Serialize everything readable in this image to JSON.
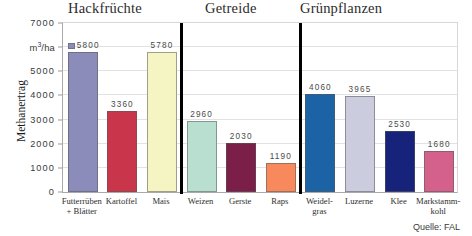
{
  "chart_data": {
    "type": "bar",
    "title": "",
    "xlabel": "",
    "ylabel": "Methanertrag",
    "yunit": "m³/ha",
    "ylim": [
      0,
      7000
    ],
    "grid": true,
    "legend_position": "none",
    "source_note": "Quelle: FAL",
    "yticks": [
      {
        "value": 7000,
        "label": "7000",
        "is_unit": false
      },
      {
        "value": 6000,
        "label": "m³/ha",
        "is_unit": true
      },
      {
        "value": 5000,
        "label": "5000",
        "is_unit": false
      },
      {
        "value": 4000,
        "label": "4000",
        "is_unit": false
      },
      {
        "value": 3000,
        "label": "3000",
        "is_unit": false
      },
      {
        "value": 2000,
        "label": "2000",
        "is_unit": false
      },
      {
        "value": 1000,
        "label": "1000",
        "is_unit": false
      },
      {
        "value": 0,
        "label": "0",
        "is_unit": false
      }
    ],
    "groups": [
      {
        "name": "Hackfrüchte",
        "start": 0,
        "count": 3
      },
      {
        "name": "Getreide",
        "start": 3,
        "count": 3
      },
      {
        "name": "Grünpflanzen",
        "start": 6,
        "count": 4
      }
    ],
    "categories": [
      "Futterrüben + Blätter",
      "Kartoffel",
      "Mais",
      "Weizen",
      "Gerste",
      "Raps",
      "Weidel-gras",
      "Luzerne",
      "Klee",
      "Markstamm-kohl"
    ],
    "values": [
      5800,
      3360,
      5780,
      2960,
      2030,
      1190,
      4060,
      3965,
      2530,
      1680
    ],
    "bars": [
      {
        "category_lines": [
          "Futterrüben",
          "+ Blätter"
        ],
        "value": 5800,
        "label": "5800",
        "color": "#8b8cba",
        "has_marker": true
      },
      {
        "category_lines": [
          "Kartoffel"
        ],
        "value": 3360,
        "label": "3360",
        "color": "#c9354a",
        "has_marker": false
      },
      {
        "category_lines": [
          "Mais"
        ],
        "value": 5780,
        "label": "5780",
        "color": "#f5f4c3",
        "has_marker": false
      },
      {
        "category_lines": [
          "Weizen"
        ],
        "value": 2960,
        "label": "2960",
        "color": "#b8dfd0",
        "has_marker": false
      },
      {
        "category_lines": [
          "Gerste"
        ],
        "value": 2030,
        "label": "2030",
        "color": "#7b1f48",
        "has_marker": false
      },
      {
        "category_lines": [
          "Raps"
        ],
        "value": 1190,
        "label": "1190",
        "color": "#f7895c",
        "has_marker": false
      },
      {
        "category_lines": [
          "Weidel-",
          "gras"
        ],
        "value": 4060,
        "label": "4060",
        "color": "#1b63a5",
        "has_marker": false
      },
      {
        "category_lines": [
          "Luzerne"
        ],
        "value": 3965,
        "label": "3965",
        "color": "#ccccdf",
        "has_marker": false
      },
      {
        "category_lines": [
          "Klee"
        ],
        "value": 2530,
        "label": "2530",
        "color": "#17237a",
        "has_marker": false
      },
      {
        "category_lines": [
          "Markstamm-",
          "kohl"
        ],
        "value": 1680,
        "label": "1680",
        "color": "#d4608c",
        "has_marker": false
      }
    ]
  }
}
